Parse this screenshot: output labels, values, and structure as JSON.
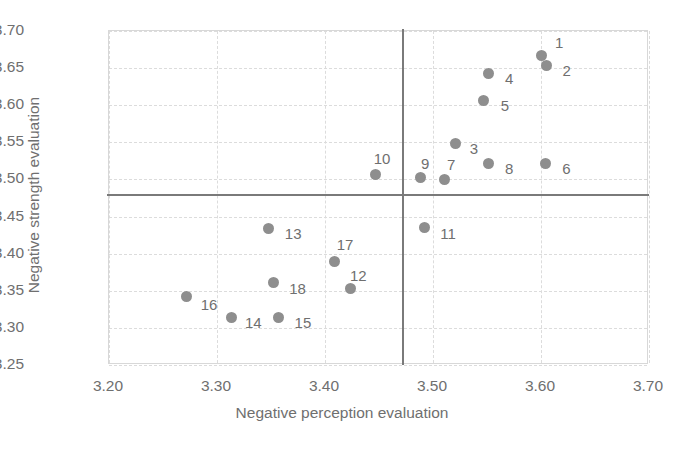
{
  "chart_data": {
    "type": "scatter",
    "title": "",
    "xlabel": "Negative perception evaluation",
    "ylabel": "Negative strength evaluation",
    "xlim": [
      3.2,
      3.7
    ],
    "ylim": [
      3.25,
      3.7
    ],
    "xticks": [
      "3.20",
      "3.30",
      "3.40",
      "3.50",
      "3.60",
      "3.70"
    ],
    "xtick_values": [
      3.2,
      3.3,
      3.4,
      3.5,
      3.6,
      3.7
    ],
    "yticks": [
      "3.25",
      "3.30",
      "3.35",
      "3.40",
      "3.45",
      "3.50",
      "3.55",
      "3.60",
      "3.65",
      "3.70"
    ],
    "ytick_values": [
      3.25,
      3.3,
      3.35,
      3.4,
      3.45,
      3.5,
      3.55,
      3.6,
      3.65,
      3.7
    ],
    "grid": true,
    "legend": "none",
    "marker_color": "#8e8e8e",
    "reference_lines": {
      "vertical_x": 3.471,
      "horizontal_y": 3.48,
      "color": "#7a7a7a"
    },
    "points": [
      {
        "label": "1",
        "x": 3.6,
        "y": 3.667,
        "lx": 14,
        "ly": -20
      },
      {
        "label": "2",
        "x": 3.605,
        "y": 3.654,
        "lx": 16,
        "ly": -2
      },
      {
        "label": "3",
        "x": 3.521,
        "y": 3.548,
        "lx": 14,
        "ly": -3
      },
      {
        "label": "4",
        "x": 3.551,
        "y": 3.643,
        "lx": 17,
        "ly": -2
      },
      {
        "label": "5",
        "x": 3.547,
        "y": 3.607,
        "lx": 17,
        "ly": -2
      },
      {
        "label": "6",
        "x": 3.604,
        "y": 3.522,
        "lx": 17,
        "ly": -2
      },
      {
        "label": "7",
        "x": 3.511,
        "y": 3.5,
        "lx": 2,
        "ly": -22
      },
      {
        "label": "8",
        "x": 3.551,
        "y": 3.522,
        "lx": 17,
        "ly": -2
      },
      {
        "label": "9",
        "x": 3.488,
        "y": 3.502,
        "lx": 1,
        "ly": -22
      },
      {
        "label": "10",
        "x": 3.447,
        "y": 3.506,
        "lx": -2,
        "ly": -24
      },
      {
        "label": "11",
        "x": 3.492,
        "y": 3.435,
        "lx": 16,
        "ly": -2
      },
      {
        "label": "12",
        "x": 3.424,
        "y": 3.353,
        "lx": -1,
        "ly": -21
      },
      {
        "label": "13",
        "x": 3.348,
        "y": 3.434,
        "lx": 16,
        "ly": -2
      },
      {
        "label": "14",
        "x": 3.313,
        "y": 3.314,
        "lx": 14,
        "ly": -2
      },
      {
        "label": "15",
        "x": 3.357,
        "y": 3.314,
        "lx": 16,
        "ly": -2
      },
      {
        "label": "16",
        "x": 3.272,
        "y": 3.342,
        "lx": 14,
        "ly": 0
      },
      {
        "label": "17",
        "x": 3.409,
        "y": 3.39,
        "lx": 2,
        "ly": -24
      },
      {
        "label": "18",
        "x": 3.352,
        "y": 3.361,
        "lx": 16,
        "ly": -2
      }
    ]
  }
}
